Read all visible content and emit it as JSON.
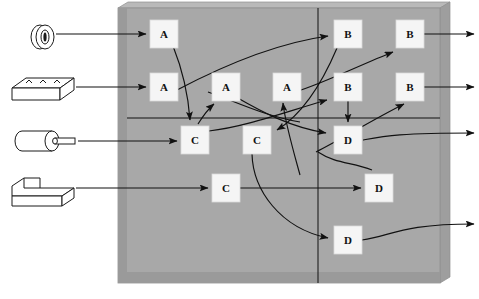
{
  "diagram": {
    "colors": {
      "panel_face": "#a8a8a8",
      "panel_top_edge": "#b9b9b9",
      "panel_left_edge": "#9a9a9a",
      "panel_bottom_edge": "#949494",
      "node_fill": "#f5f5f5",
      "node_stroke": "#d9d9d9",
      "line": "#111111",
      "part_fill": "#ffffff",
      "part_stroke": "#1a1a1a",
      "background": "#ffffff"
    },
    "panel": {
      "name": "processing-panel",
      "x": 118,
      "y": 8,
      "width": 322,
      "height": 275,
      "grid": {
        "vertical_x": 318,
        "horizontal_y": 118
      }
    },
    "input_parts": [
      {
        "id": "part-1",
        "icon": "washer-ring-icon",
        "shape": "ring",
        "x": 28,
        "y": 24,
        "width": 30,
        "height": 26,
        "arrow_to": "node-a1"
      },
      {
        "id": "part-2",
        "icon": "slab-block-icon",
        "shape": "slab",
        "x": 10,
        "y": 76,
        "width": 64,
        "height": 28,
        "arrow_to": "node-a2"
      },
      {
        "id": "part-3",
        "icon": "cylinder-shaft-icon",
        "shape": "cylinder",
        "x": 10,
        "y": 129,
        "width": 68,
        "height": 24,
        "arrow_to": "node-c1"
      },
      {
        "id": "part-4",
        "icon": "notched-block-icon",
        "shape": "lblock",
        "x": 10,
        "y": 177,
        "width": 68,
        "height": 30,
        "arrow_to": "node-c3"
      }
    ],
    "nodes": [
      {
        "id": "node-a1",
        "label": "A",
        "x": 150,
        "y": 20,
        "size": 28,
        "column": 1,
        "row": 1
      },
      {
        "id": "node-a2",
        "label": "A",
        "x": 150,
        "y": 73,
        "size": 28,
        "column": 1,
        "row": 2
      },
      {
        "id": "node-a3",
        "label": "A",
        "x": 212,
        "y": 73,
        "size": 28,
        "column": 2,
        "row": 2
      },
      {
        "id": "node-a4",
        "label": "A",
        "x": 273,
        "y": 73,
        "size": 28,
        "column": 3,
        "row": 2
      },
      {
        "id": "node-b1",
        "label": "B",
        "x": 334,
        "y": 20,
        "size": 28,
        "column": 4,
        "row": 1
      },
      {
        "id": "node-b2",
        "label": "B",
        "x": 396,
        "y": 20,
        "size": 28,
        "column": 5,
        "row": 1
      },
      {
        "id": "node-b3",
        "label": "B",
        "x": 334,
        "y": 73,
        "size": 28,
        "column": 4,
        "row": 2
      },
      {
        "id": "node-b4",
        "label": "B",
        "x": 396,
        "y": 73,
        "size": 28,
        "column": 5,
        "row": 2
      },
      {
        "id": "node-c1",
        "label": "C",
        "x": 181,
        "y": 126,
        "size": 28,
        "column": 1,
        "row": 3
      },
      {
        "id": "node-c2",
        "label": "C",
        "x": 243,
        "y": 126,
        "size": 28,
        "column": 2,
        "row": 3
      },
      {
        "id": "node-d1",
        "label": "D",
        "x": 334,
        "y": 126,
        "size": 28,
        "column": 4,
        "row": 3
      },
      {
        "id": "node-c3",
        "label": "C",
        "x": 212,
        "y": 174,
        "size": 28,
        "column": 2,
        "row": 4
      },
      {
        "id": "node-d2",
        "label": "D",
        "x": 365,
        "y": 174,
        "size": 28,
        "column": 4,
        "row": 4
      },
      {
        "id": "node-d3",
        "label": "D",
        "x": 334,
        "y": 226,
        "size": 28,
        "column": 4,
        "row": 5
      }
    ],
    "output_arrows": [
      {
        "id": "output-1",
        "y": 34,
        "from_x": 424,
        "to_x": 474
      },
      {
        "id": "output-2",
        "y": 87,
        "from_x": 424,
        "to_x": 474
      },
      {
        "id": "output-3",
        "y": 133,
        "from_x": 405,
        "to_x": 474
      },
      {
        "id": "output-4",
        "y": 224,
        "from_x": 420,
        "to_x": 474
      }
    ],
    "routing_connections": [
      {
        "from": "node-a1",
        "to": "node-c1",
        "style": "curve"
      },
      {
        "from": "node-a2",
        "to": "node-b1",
        "style": "long-curve"
      },
      {
        "from": "node-c1",
        "to": "node-a3",
        "style": "short-curve"
      },
      {
        "from": "node-c1",
        "to": "node-b3",
        "style": "curve"
      },
      {
        "from": "node-a3",
        "to": "node-d1",
        "style": "curve"
      },
      {
        "from": "node-a4",
        "to": "node-b2",
        "style": "curve"
      },
      {
        "from": "node-b1",
        "to": "node-c2",
        "style": "curve"
      },
      {
        "from": "node-b3",
        "to": "node-d1",
        "style": "straight-down"
      },
      {
        "from": "node-c2",
        "to": "node-d3",
        "style": "long-curve"
      },
      {
        "from": "node-c3",
        "to": "node-d2",
        "style": "straight"
      },
      {
        "from": "node-d1",
        "to": "node-d2",
        "style": "curve"
      },
      {
        "from": "node-d2",
        "to": "node-a4",
        "style": "curve"
      },
      {
        "from": "node-d1",
        "to": "node-b4",
        "style": "curve"
      },
      {
        "from": "node-d3",
        "to": "output-4",
        "style": "curve"
      }
    ]
  }
}
